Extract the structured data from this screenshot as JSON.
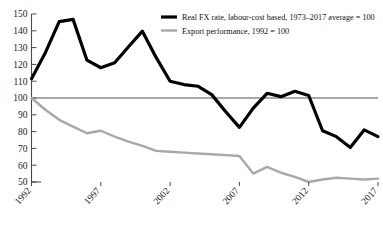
{
  "chart_data": {
    "type": "line",
    "title": "",
    "subtitle": "",
    "xlabel": "",
    "ylabel": "",
    "x": [
      1992,
      1993,
      1994,
      1995,
      1996,
      1997,
      1998,
      1999,
      2000,
      2001,
      2002,
      2003,
      2004,
      2005,
      2006,
      2007,
      2008,
      2009,
      2010,
      2011,
      2012,
      2013,
      2014,
      2015,
      2016,
      2017
    ],
    "xlim": [
      1992,
      2017
    ],
    "ylim": [
      50,
      150
    ],
    "yticks": [
      50,
      60,
      70,
      80,
      90,
      100,
      110,
      120,
      130,
      140,
      150
    ],
    "xticks": [
      1992,
      1997,
      2002,
      2007,
      2012,
      2017
    ],
    "grid": false,
    "legend_position": "top-right",
    "reference_line": {
      "value": 100,
      "label": "100"
    },
    "series": [
      {
        "name": "Real FX rate, labour-cost based, 1973–2017 average = 100",
        "color": "#000000",
        "width": 3.2,
        "values": [
          111.5,
          127.0,
          145.5,
          146.8,
          122.5,
          118.0,
          121.0,
          130.5,
          139.8,
          124.0,
          110.0,
          108.0,
          107.0,
          102.0,
          92.0,
          82.5,
          94.0,
          102.8,
          100.8,
          104.0,
          101.5,
          80.5,
          77.0,
          70.5,
          81.0,
          77.0
        ]
      },
      {
        "name": "Export performance, 1992 = 100",
        "color": "#a8a8a8",
        "width": 2.4,
        "values": [
          100.0,
          93.0,
          87.0,
          83.0,
          79.0,
          80.5,
          77.0,
          74.0,
          71.5,
          68.5,
          68.0,
          67.5,
          67.0,
          66.5,
          66.0,
          65.5,
          55.0,
          59.0,
          55.5,
          53.0,
          50.0,
          51.5,
          52.5,
          52.0,
          51.5,
          52.0
        ]
      }
    ]
  },
  "axis": {
    "y_tick_labels": [
      "150",
      "140",
      "130",
      "120",
      "110",
      "100",
      "90",
      "80",
      "70",
      "60",
      "50"
    ],
    "x_tick_labels": [
      "1992",
      "1997",
      "2002",
      "2007",
      "2012",
      "2017"
    ]
  },
  "legend": {
    "items": [
      {
        "label": "Real FX rate, labour-cost based, 1973–2017 average = 100",
        "color": "#000000",
        "swatch": "thick-black-line-swatch"
      },
      {
        "label": "Export performance, 1992 = 100",
        "color": "#a8a8a8",
        "swatch": "grey-line-swatch"
      }
    ]
  },
  "colors": {
    "series_black": "#000000",
    "series_grey": "#a8a8a8",
    "axis": "#4a4a4a",
    "text": "#1a1a1a",
    "background": "#ffffff"
  }
}
